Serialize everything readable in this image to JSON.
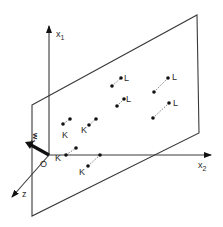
{
  "diagram": {
    "axes": {
      "x1": {
        "label": "x",
        "subscript": "1"
      },
      "x2": {
        "label": "x",
        "subscript": "2"
      },
      "z": {
        "label": "z"
      },
      "origin": {
        "label": "O"
      }
    },
    "weight_vector": {
      "label": "w",
      "subscript": "1"
    },
    "class_labels": {
      "K": "K",
      "L": "L"
    },
    "points": {
      "K": [
        {
          "a": [
            63,
            124
          ],
          "b": [
            70,
            119
          ],
          "label_pos": [
            62,
            138
          ]
        },
        {
          "a": [
            89,
            125
          ],
          "b": [
            96,
            119
          ],
          "label_pos": [
            81,
            133
          ]
        },
        {
          "a": [
            66,
            155
          ],
          "b": [
            76,
            148
          ],
          "label_pos": [
            55,
            161
          ]
        },
        {
          "a": [
            82,
            168
          ],
          "b": [
            100,
            154
          ],
          "label_pos": [
            79,
            175
          ]
        }
      ],
      "L": [
        {
          "a": [
            112,
            86
          ],
          "b": [
            121,
            78
          ],
          "label_pos": [
            124,
            80
          ]
        },
        {
          "a": [
            117,
            106
          ],
          "b": [
            124,
            99
          ],
          "label_pos": [
            126,
            102
          ]
        },
        {
          "a": [
            154,
            92
          ],
          "b": [
            168,
            78
          ],
          "label_pos": [
            172,
            80
          ]
        },
        {
          "a": [
            153,
            118
          ],
          "b": [
            169,
            103
          ],
          "label_pos": [
            173,
            106
          ]
        }
      ]
    },
    "colors": {
      "line": "#3a3a3a",
      "point": "#111111",
      "background": "#ffffff"
    }
  }
}
